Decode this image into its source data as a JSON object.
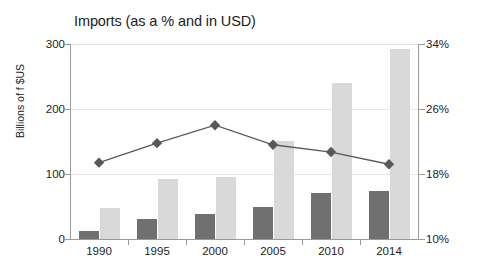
{
  "chart_data": {
    "type": "bar",
    "title": "Imports (as a % and in USD)",
    "xlabel": "",
    "ylabel": "Billions of f $US",
    "ylabel_right": "",
    "categories": [
      "1990",
      "1995",
      "2000",
      "2005",
      "2010",
      "2014"
    ],
    "ylim": [
      0,
      300
    ],
    "yticks": [
      0,
      100,
      200,
      300
    ],
    "ytick_labels": [
      "0",
      "100",
      "200",
      "300"
    ],
    "ylim_right": [
      10,
      34
    ],
    "yticks_right": [
      10,
      18,
      26,
      34
    ],
    "ytick_labels_right": [
      "10%",
      "18%",
      "26%",
      "34%"
    ],
    "grid": true,
    "legend": "none",
    "series": [
      {
        "name": "Imports in USD (dark bars)",
        "kind": "bar",
        "axis": "left",
        "color": "#707070",
        "values": [
          12,
          31,
          39,
          49,
          71,
          74
        ]
      },
      {
        "name": "Imports in USD (light bars)",
        "kind": "bar",
        "axis": "left",
        "color": "#d9d9d9",
        "values": [
          48,
          93,
          95,
          151,
          240,
          293
        ]
      },
      {
        "name": "Imports as a %",
        "kind": "line",
        "axis": "right",
        "color": "#595959",
        "marker": "diamond",
        "values": [
          19.4,
          21.8,
          24.0,
          21.6,
          20.7,
          19.2
        ]
      }
    ]
  },
  "colors": {
    "bar_dark": "#707070",
    "bar_light": "#d9d9d9",
    "line": "#595959",
    "grid": "#e6e6e6",
    "axis": "#9a9a9a",
    "text": "#1c1c1c",
    "background": "#ffffff"
  }
}
